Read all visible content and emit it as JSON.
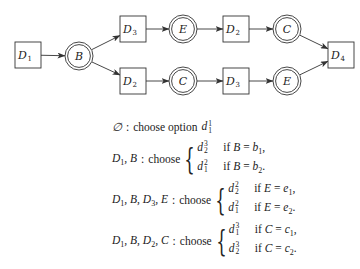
{
  "diagram": {
    "nodes": [
      {
        "id": "D1",
        "shape": "box",
        "label": "D",
        "sub": "1",
        "cx": 28,
        "cy": 55
      },
      {
        "id": "B",
        "shape": "double-circle",
        "label": "B",
        "sub": "",
        "cx": 79,
        "cy": 56
      },
      {
        "id": "D3_top",
        "shape": "box",
        "label": "D",
        "sub": "3",
        "cx": 133,
        "cy": 29
      },
      {
        "id": "E_top",
        "shape": "double-circle",
        "label": "E",
        "sub": "",
        "cx": 183,
        "cy": 29
      },
      {
        "id": "D2_top",
        "shape": "box",
        "label": "D",
        "sub": "2",
        "cx": 236,
        "cy": 29
      },
      {
        "id": "C_top",
        "shape": "double-circle",
        "label": "C",
        "sub": "",
        "cx": 287,
        "cy": 29
      },
      {
        "id": "D2_bot",
        "shape": "box",
        "label": "D",
        "sub": "2",
        "cx": 133,
        "cy": 81
      },
      {
        "id": "C_bot",
        "shape": "double-circle",
        "label": "C",
        "sub": "",
        "cx": 183,
        "cy": 81
      },
      {
        "id": "D3_bot",
        "shape": "box",
        "label": "D",
        "sub": "3",
        "cx": 236,
        "cy": 81
      },
      {
        "id": "E_bot",
        "shape": "double-circle",
        "label": "E",
        "sub": "",
        "cx": 287,
        "cy": 81
      },
      {
        "id": "D4",
        "shape": "box",
        "label": "D",
        "sub": "4",
        "cx": 341,
        "cy": 55
      }
    ],
    "edges": [
      [
        "D1",
        "B"
      ],
      [
        "B",
        "D3_top"
      ],
      [
        "B",
        "D2_bot"
      ],
      [
        "D3_top",
        "E_top"
      ],
      [
        "E_top",
        "D2_top"
      ],
      [
        "D2_top",
        "C_top"
      ],
      [
        "C_top",
        "D4"
      ],
      [
        "D2_bot",
        "C_bot"
      ],
      [
        "C_bot",
        "D3_bot"
      ],
      [
        "D3_bot",
        "E_bot"
      ],
      [
        "E_bot",
        "D4"
      ]
    ],
    "line_color": "#333333"
  },
  "rules": {
    "r0": {
      "lhs": "∅",
      "sep": ":",
      "text": "choose option",
      "opt_base": "d",
      "opt_sup": "1",
      "opt_sub": "1"
    },
    "r1": {
      "lhs_parts": [
        "D",
        "1",
        ", B"
      ],
      "sep": ":",
      "text": "choose",
      "cases": [
        {
          "opt_sup": "3",
          "opt_sub": "2",
          "if": "if",
          "var": "B",
          "eq": "=",
          "val": "b",
          "val_sub": "1",
          "end": ","
        },
        {
          "opt_sup": "2",
          "opt_sub": "1",
          "if": "if",
          "var": "B",
          "eq": "=",
          "val": "b",
          "val_sub": "2",
          "end": "."
        }
      ]
    },
    "r2": {
      "lhs_parts": [
        "D",
        "1",
        ", B, D",
        "3",
        ", E"
      ],
      "sep": ":",
      "text": "choose",
      "cases": [
        {
          "opt_sup": "2",
          "opt_sub": "2",
          "if": "if",
          "var": "E",
          "eq": "=",
          "val": "e",
          "val_sub": "1",
          "end": ","
        },
        {
          "opt_sup": "2",
          "opt_sub": "1",
          "if": "if",
          "var": "E",
          "eq": "=",
          "val": "e",
          "val_sub": "2",
          "end": "."
        }
      ]
    },
    "r3": {
      "lhs_parts": [
        "D",
        "1",
        ", B, D",
        "2",
        ", C"
      ],
      "sep": ":",
      "text": "choose",
      "cases": [
        {
          "opt_sup": "3",
          "opt_sub": "1",
          "if": "if",
          "var": "C",
          "eq": "=",
          "val": "c",
          "val_sub": "1",
          "end": ","
        },
        {
          "opt_sup": "3",
          "opt_sub": "2",
          "if": "if",
          "var": "C",
          "eq": "=",
          "val": "c",
          "val_sub": "2",
          "end": "."
        }
      ]
    },
    "opt_base": "d"
  }
}
